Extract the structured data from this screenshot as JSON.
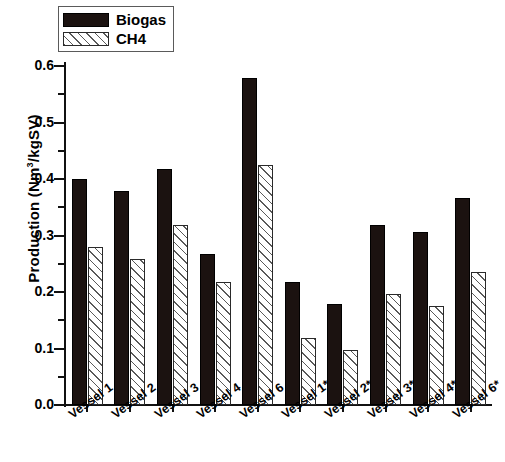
{
  "chart_data": {
    "type": "bar",
    "title": "",
    "xlabel": "",
    "ylabel": "Production (Nm3/kgSV)",
    "ylabel_prefix": "Production (Nm",
    "ylabel_sup": "3",
    "ylabel_suffix": "/kgSV)",
    "ylim": [
      0.0,
      0.6
    ],
    "ytick_labels": [
      "0.0",
      "0.1",
      "0.2",
      "0.3",
      "0.4",
      "0.5",
      "0.6"
    ],
    "ytick_values": [
      0.0,
      0.1,
      0.2,
      0.3,
      0.4,
      0.5,
      0.6
    ],
    "minor_ticks": true,
    "minor_tick_values": [
      0.05,
      0.15,
      0.25,
      0.35,
      0.45,
      0.55
    ],
    "grid": false,
    "legend_position": "top-left",
    "categories": [
      "Vessel 1",
      "Vessel 2",
      "Vessel 3",
      "Vessel 4",
      "Vessel 6",
      "Vessel 1*",
      "Vessel 2*",
      "Vessel 3*",
      "Vessel 4*",
      "Vessel 6*"
    ],
    "series": [
      {
        "name": "Biogas",
        "color": "#1b1210",
        "fill": "solid-black",
        "values": [
          0.4,
          0.378,
          0.418,
          0.268,
          0.578,
          0.218,
          0.178,
          0.318,
          0.307,
          0.367
        ]
      },
      {
        "name": "CH4",
        "color": "#ffffff",
        "fill": "diagonal-hatch",
        "values": [
          0.279,
          0.259,
          0.319,
          0.218,
          0.425,
          0.119,
          0.098,
          0.197,
          0.176,
          0.235
        ]
      }
    ]
  },
  "legend": {
    "items": [
      {
        "label": "Biogas",
        "swatch": "solid-black-swatch"
      },
      {
        "label": "CH4",
        "swatch": "hatched-swatch"
      }
    ]
  }
}
